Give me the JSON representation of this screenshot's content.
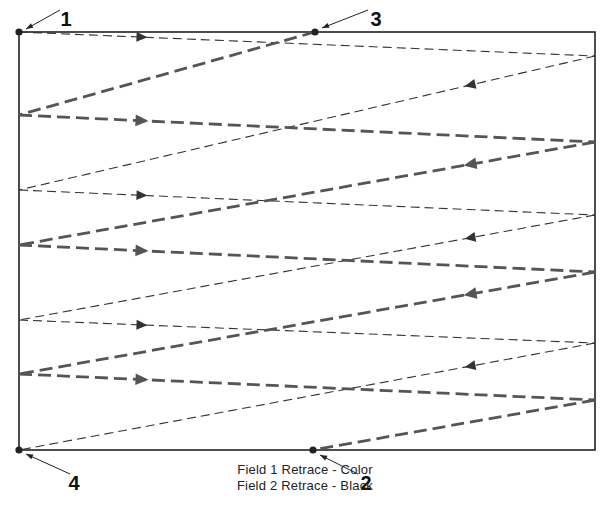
{
  "diagram": {
    "frame": {
      "x1": 19,
      "y1": 32,
      "x2": 595,
      "y2": 450,
      "color": "#222222"
    },
    "colors": {
      "field1": "#555555",
      "field2": "#333333",
      "ink": "#222222"
    },
    "points": [
      {
        "id": "1",
        "label": "1",
        "x": 19,
        "y": 32,
        "label_x": 66,
        "label_y": 26,
        "leader": [
          60,
          10,
          26,
          29
        ]
      },
      {
        "id": "3",
        "label": "3",
        "x": 315,
        "y": 32,
        "label_x": 376,
        "label_y": 26,
        "leader": [
          368,
          10,
          322,
          28
        ]
      },
      {
        "id": "4",
        "label": "4",
        "x": 19,
        "y": 450,
        "label_x": 74,
        "label_y": 490,
        "leader": [
          70,
          474,
          26,
          454
        ]
      },
      {
        "id": "2",
        "label": "2",
        "x": 313,
        "y": 450,
        "label_x": 366,
        "label_y": 490,
        "leader": [
          358,
          474,
          320,
          455
        ]
      }
    ],
    "field1_lines": [
      {
        "x1": 315,
        "y1": 32,
        "x2": 19,
        "y2": 115,
        "dir": "none"
      },
      {
        "x1": 19,
        "y1": 115,
        "x2": 595,
        "y2": 142,
        "dir": "left"
      },
      {
        "x1": 595,
        "y1": 142,
        "x2": 19,
        "y2": 245,
        "dir": "right"
      },
      {
        "x1": 19,
        "y1": 245,
        "x2": 595,
        "y2": 272,
        "dir": "left"
      },
      {
        "x1": 595,
        "y1": 272,
        "x2": 19,
        "y2": 374,
        "dir": "right"
      },
      {
        "x1": 19,
        "y1": 374,
        "x2": 595,
        "y2": 400,
        "dir": "left"
      },
      {
        "x1": 595,
        "y1": 400,
        "x2": 313,
        "y2": 450,
        "dir": "none"
      }
    ],
    "field2_lines": [
      {
        "x1": 19,
        "y1": 32,
        "x2": 595,
        "y2": 56,
        "dir": "left"
      },
      {
        "x1": 595,
        "y1": 56,
        "x2": 19,
        "y2": 190,
        "dir": "right"
      },
      {
        "x1": 19,
        "y1": 190,
        "x2": 595,
        "y2": 215,
        "dir": "left"
      },
      {
        "x1": 595,
        "y1": 215,
        "x2": 19,
        "y2": 320,
        "dir": "right"
      },
      {
        "x1": 19,
        "y1": 320,
        "x2": 595,
        "y2": 343,
        "dir": "left"
      },
      {
        "x1": 595,
        "y1": 343,
        "x2": 19,
        "y2": 450,
        "dir": "right"
      }
    ],
    "caption": {
      "line1": "Field 1 Retrace - Color",
      "line2": "Field 2 Retrace - Black"
    }
  }
}
